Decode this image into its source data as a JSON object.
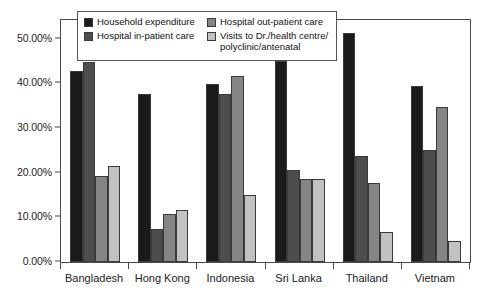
{
  "chart_data": {
    "type": "bar",
    "title": "",
    "subtitle": "",
    "xlabel": "",
    "ylabel": "",
    "categories": [
      "Bangladesh",
      "Hong Kong",
      "Indonesia",
      "Sri Lanka",
      "Thailand",
      "Vietnam"
    ],
    "series": [
      {
        "name": "Household expenditure",
        "color": "#1a1a1a",
        "values": [
          42.8,
          37.7,
          39.9,
          45.1,
          51.2,
          39.5
        ]
      },
      {
        "name": "Hospital in-patient care",
        "color": "#4d4d4d",
        "values": [
          44.8,
          7.3,
          37.7,
          20.7,
          23.8,
          25.0
        ]
      },
      {
        "name": "Hospital out-patient care",
        "color": "#858585",
        "values": [
          19.3,
          10.7,
          41.7,
          18.7,
          17.6,
          34.8
        ]
      },
      {
        "name": "Visits to Dr./health centre/\npolyclinic/antenatal",
        "color": "#c2c2c2",
        "values": [
          21.5,
          11.6,
          14.9,
          18.7,
          6.7,
          4.6
        ]
      }
    ],
    "ylim": [
      0,
      54.2
    ],
    "yticks": [
      0,
      10,
      20,
      30,
      40,
      50
    ],
    "ytick_labels": [
      "0.00%",
      "10.00%",
      "20.00%",
      "30.00%",
      "40.00%",
      "50.00%"
    ],
    "grid": false,
    "legend_position": "top-center",
    "value_format": "percent"
  },
  "legend": {
    "items": [
      {
        "label": "Household expenditure",
        "color": "#1a1a1a"
      },
      {
        "label": "Hospital in-patient care",
        "color": "#4d4d4d"
      },
      {
        "label": "Hospital out-patient care",
        "color": "#858585"
      },
      {
        "label": "Visits to Dr./health centre/\npolyclinic/antenatal",
        "color": "#c2c2c2"
      }
    ]
  }
}
